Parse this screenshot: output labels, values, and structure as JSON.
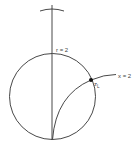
{
  "diagram": {
    "type": "smith-chart-sketch",
    "labels": {
      "r_circle": "r = 2",
      "x_arc": "x = 2",
      "point": "z",
      "point_subscript": "L"
    },
    "colors": {
      "stroke": "#333333",
      "background": "#ffffff",
      "point": "#111111"
    }
  }
}
